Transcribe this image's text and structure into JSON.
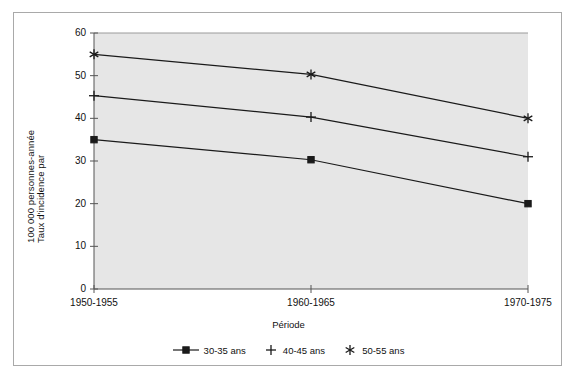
{
  "chart_data": {
    "type": "line",
    "title": "",
    "xlabel": "Période",
    "ylabel_line_1": "Taux d'incidence par",
    "ylabel_line_2": "100 000 personnes-année",
    "categories": [
      "1950-1955",
      "1960-1965",
      "1970-1975"
    ],
    "ylim": [
      0,
      60
    ],
    "yticks": [
      0,
      10,
      20,
      30,
      40,
      50,
      60
    ],
    "ytick_labels": [
      "0",
      "10",
      "20",
      "30",
      "40",
      "50",
      "60"
    ],
    "grid": false,
    "legend_position": "bottom",
    "plot_background": "#e6e6e6",
    "line_color": "#1a1a1a",
    "series": [
      {
        "name": "30-35 ans",
        "marker": "square",
        "values": [
          35,
          30.3,
          20
        ]
      },
      {
        "name": "40-45 ans",
        "marker": "plus",
        "values": [
          45.3,
          40.3,
          31
        ]
      },
      {
        "name": "50-55 ans",
        "marker": "asterisk",
        "values": [
          55,
          50.3,
          40
        ]
      }
    ]
  },
  "legend": {
    "items": [
      {
        "label": "30-35 ans",
        "marker": "square"
      },
      {
        "label": "40-45 ans",
        "marker": "plus"
      },
      {
        "label": "50-55 ans",
        "marker": "asterisk"
      }
    ]
  }
}
